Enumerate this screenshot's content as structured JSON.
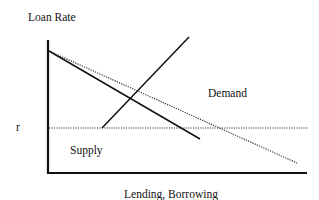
{
  "diagram": {
    "title": "",
    "y_axis_label": "Loan Rate",
    "x_axis_label": "Lending, Borrowing",
    "rate_marker_label": "r",
    "curve_labels": {
      "demand": "Demand",
      "supply": "Supply"
    },
    "colors": {
      "line": "#111111",
      "dotted": "#333333",
      "background": "#ffffff"
    },
    "geometry": {
      "axes": {
        "origin": [
          48,
          173
        ],
        "y_top": 40,
        "x_right": 307
      },
      "rate_line": {
        "y": 128,
        "x1": 48,
        "x2": 307,
        "style": "dotted"
      },
      "demand_solid": {
        "x1": 48,
        "y1": 51,
        "x2": 200,
        "y2": 139,
        "style": "solid"
      },
      "demand_dotted": {
        "x1": 48,
        "y1": 51,
        "x2": 297,
        "y2": 163,
        "style": "dotted"
      },
      "supply_solid": {
        "x1": 102,
        "y1": 128,
        "x2": 189,
        "y2": 37,
        "style": "solid"
      }
    }
  }
}
